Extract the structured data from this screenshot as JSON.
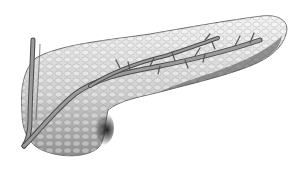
{
  "image": {
    "subject": "pancreas",
    "style": "grayscale anatomical illustration",
    "background": "#ffffff",
    "colors": {
      "organ_light": "#e6e6e6",
      "organ_mid": "#bdbdbd",
      "organ_dark": "#3a3a3a",
      "duct": "#8a8a8a",
      "duct_outline": "#4a4a4a"
    }
  }
}
